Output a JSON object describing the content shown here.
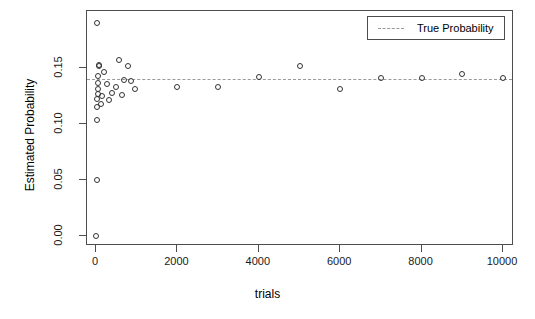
{
  "chart_data": {
    "type": "scatter",
    "title": "",
    "xlabel": "trials",
    "ylabel": "Estimated Probability",
    "xlim": [
      -300,
      10500
    ],
    "ylim": [
      -0.004,
      0.198
    ],
    "xticks": [
      0,
      2000,
      4000,
      6000,
      8000,
      10000
    ],
    "xtick_labels": [
      "0",
      "2000",
      "4000",
      "6000",
      "8000",
      "10000"
    ],
    "yticks": [
      0.0,
      0.05,
      0.1,
      0.15
    ],
    "ytick_labels": [
      "0.00",
      "0.05",
      "0.10",
      "0.15"
    ],
    "grid": false,
    "legend_position": "top-right",
    "series": [
      {
        "name": "Estimated Probability",
        "marker": "open-circle",
        "color": "#333333",
        "points": [
          {
            "x": 10,
            "y": 0.0
          },
          {
            "x": 15,
            "y": 0.05
          },
          {
            "x": 20,
            "y": 0.19
          },
          {
            "x": 25,
            "y": 0.104
          },
          {
            "x": 30,
            "y": 0.115
          },
          {
            "x": 35,
            "y": 0.122
          },
          {
            "x": 40,
            "y": 0.127
          },
          {
            "x": 45,
            "y": 0.131
          },
          {
            "x": 50,
            "y": 0.137
          },
          {
            "x": 60,
            "y": 0.143
          },
          {
            "x": 70,
            "y": 0.152
          },
          {
            "x": 80,
            "y": 0.153
          },
          {
            "x": 120,
            "y": 0.118
          },
          {
            "x": 150,
            "y": 0.125
          },
          {
            "x": 200,
            "y": 0.146
          },
          {
            "x": 260,
            "y": 0.136
          },
          {
            "x": 320,
            "y": 0.121
          },
          {
            "x": 400,
            "y": 0.128
          },
          {
            "x": 480,
            "y": 0.133
          },
          {
            "x": 560,
            "y": 0.157
          },
          {
            "x": 640,
            "y": 0.126
          },
          {
            "x": 700,
            "y": 0.139
          },
          {
            "x": 780,
            "y": 0.152
          },
          {
            "x": 860,
            "y": 0.138
          },
          {
            "x": 950,
            "y": 0.131
          },
          {
            "x": 2000,
            "y": 0.133
          },
          {
            "x": 3000,
            "y": 0.133
          },
          {
            "x": 4000,
            "y": 0.142
          },
          {
            "x": 5000,
            "y": 0.152
          },
          {
            "x": 6000,
            "y": 0.131
          },
          {
            "x": 7000,
            "y": 0.141
          },
          {
            "x": 8000,
            "y": 0.141
          },
          {
            "x": 9000,
            "y": 0.145
          },
          {
            "x": 10000,
            "y": 0.141
          }
        ]
      }
    ],
    "reference_line": {
      "label": "True Probability",
      "value": 0.14,
      "style": "dashed",
      "color": "#9a9a9a"
    }
  },
  "legend": {
    "entries": [
      {
        "label": "True Probability",
        "style": "dashed",
        "color": "#9a9a9a"
      }
    ]
  },
  "axes": {
    "x_title": "trials",
    "y_title": "Estimated Probability"
  }
}
